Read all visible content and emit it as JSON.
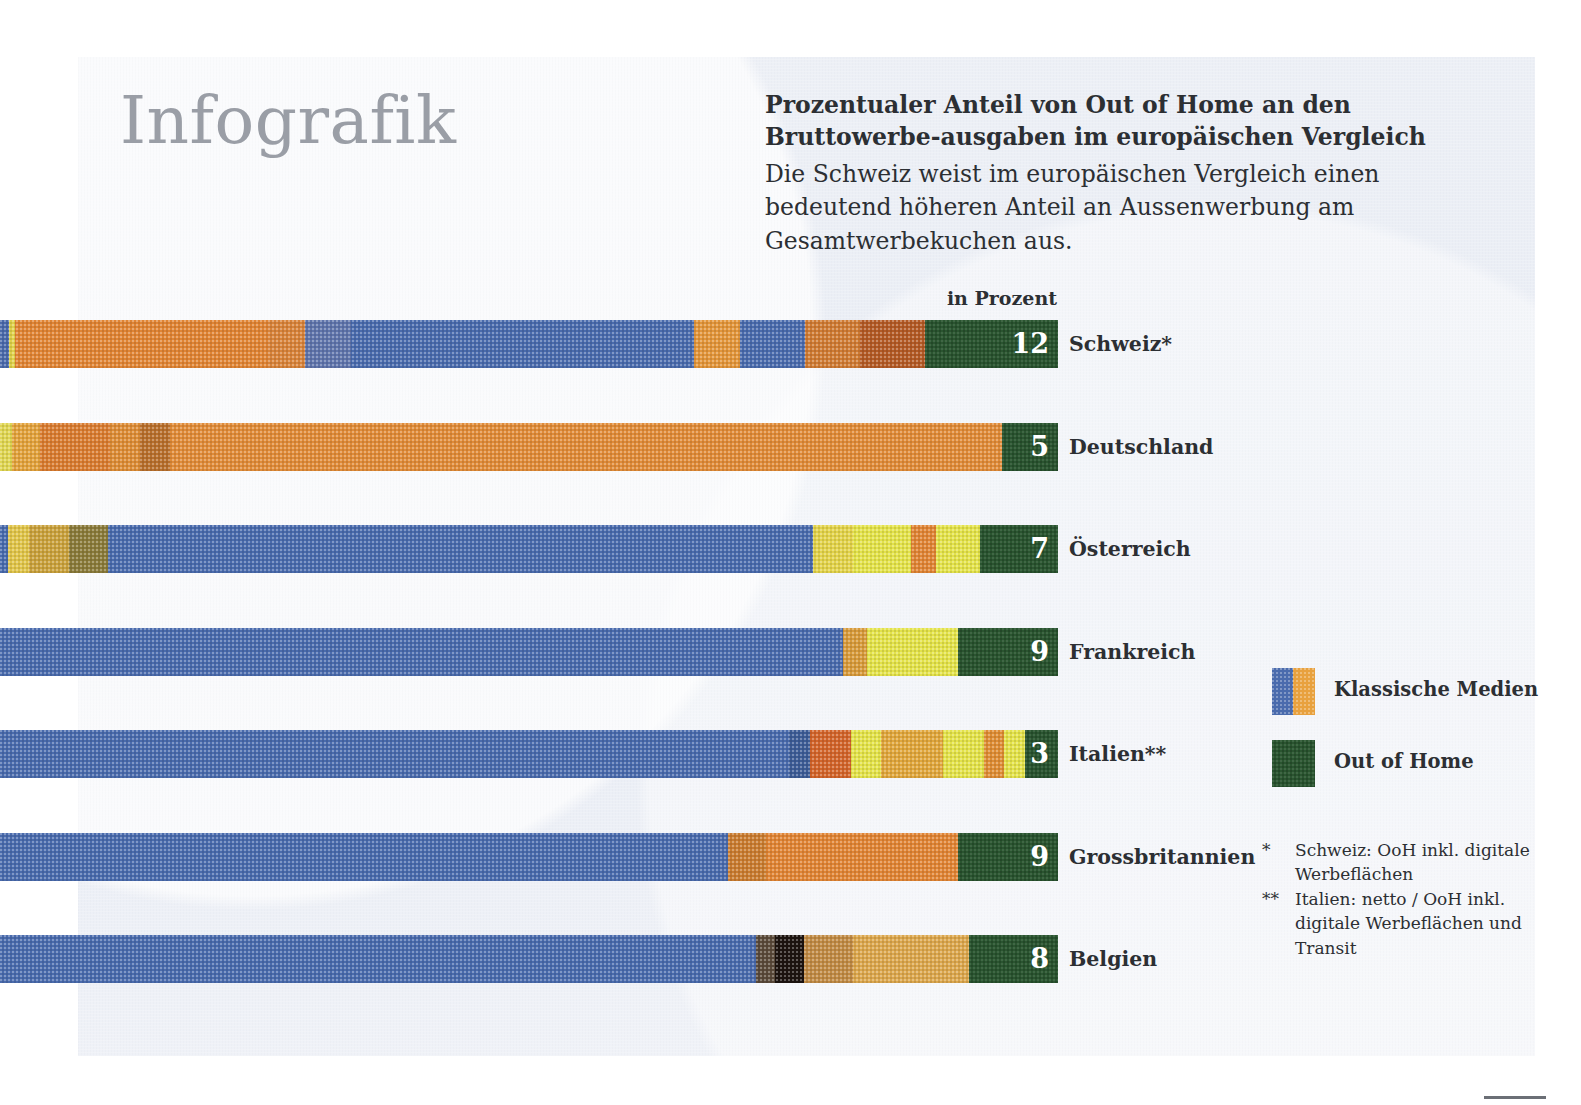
{
  "header": {
    "title": "Infografik",
    "headline": "Prozentualer Anteil von Out of Home an den Bruttowerbe-ausgaben im europäischen Vergleich",
    "subhead": "Die Schweiz weist im europäischen Vergleich einen bedeutend höheren Anteil an Aussenwerbung am Gesamtwerbekuchen aus."
  },
  "chart_data": {
    "type": "bar",
    "unit_label": "in Prozent",
    "xlabel": "",
    "ylabel": "",
    "grid": false,
    "legend_position": "right",
    "orientation": "horizontal-stacked",
    "categories": [
      "Schweiz*",
      "Deutschland",
      "Österreich",
      "Frankreich",
      "Italien**",
      "Grossbritannien",
      "Belgien"
    ],
    "values": [
      12,
      5,
      7,
      9,
      3,
      9,
      8
    ],
    "series": [
      {
        "name": "Out of Home",
        "color": "#2a5530",
        "values": [
          12,
          5,
          7,
          9,
          3,
          9,
          8
        ]
      },
      {
        "name": "Klassische Medien",
        "color": "#4a6bad",
        "values": [
          88,
          95,
          93,
          91,
          97,
          91,
          92
        ]
      }
    ],
    "rows": [
      {
        "label": "Schweiz*",
        "value": "12",
        "ooh": 12
      },
      {
        "label": "Deutschland",
        "value": "5",
        "ooh": 5
      },
      {
        "label": "Österreich",
        "value": "7",
        "ooh": 7
      },
      {
        "label": "Frankreich",
        "value": "9",
        "ooh": 9
      },
      {
        "label": "Italien**",
        "value": "3",
        "ooh": 3
      },
      {
        "label": "Grossbritannien",
        "value": "9",
        "ooh": 9
      },
      {
        "label": "Belgien",
        "value": "8",
        "ooh": 8
      }
    ]
  },
  "legend": {
    "items": [
      {
        "label": "Klassische Medien",
        "color": "#4a6bad"
      },
      {
        "label": "Out of Home",
        "color": "#2a5530"
      }
    ]
  },
  "footnotes": [
    {
      "mark": "*",
      "text": "Schweiz: OoH inkl. digitale Werbeflächen"
    },
    {
      "mark": "**",
      "text": "Italien: netto / OoH inkl. digitale Werbeflächen und Transit"
    }
  ],
  "colors": {
    "panel": "#eef1f7",
    "ooh_green": "#2a5530",
    "media_blue": "#4a6bad",
    "media_orange": "#e08434",
    "media_yellow": "#e3e24a",
    "title_grey": "#9a9ea6",
    "text": "#2c2f33"
  }
}
